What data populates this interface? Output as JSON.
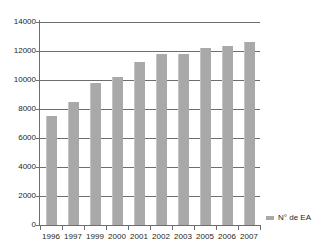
{
  "chart_data": {
    "type": "bar",
    "title": "",
    "subtitle": "",
    "xlabel": "",
    "ylabel": "",
    "categories": [
      "1996",
      "1997",
      "1999",
      "2000",
      "2001",
      "2002",
      "2003",
      "2005",
      "2006",
      "2007"
    ],
    "series": [
      {
        "name": "N° de EA",
        "values": [
          7500,
          8500,
          9800,
          10200,
          11250,
          11800,
          11800,
          12200,
          12350,
          12600
        ]
      }
    ],
    "ylim": [
      0,
      14000
    ],
    "y_ticks": [
      0,
      2000,
      4000,
      6000,
      8000,
      10000,
      12000,
      14000
    ],
    "y_tick_labels": [
      "0",
      "2000",
      "4000",
      "6000",
      "8000",
      "10000",
      "12000",
      "14000"
    ],
    "grid": true,
    "grid_axis": "y",
    "legend": {
      "position": "right-bottom",
      "entries": [
        {
          "label": "N° de EA",
          "color": "#a9a9a9",
          "marker": "square"
        }
      ]
    },
    "colors": {
      "bar": "#a9a9a9",
      "bar_edge": "#c4c4c4",
      "axis": "#6d6e71",
      "grid": "#6d6e71",
      "text": "#231f20",
      "background": "#ffffff"
    }
  }
}
